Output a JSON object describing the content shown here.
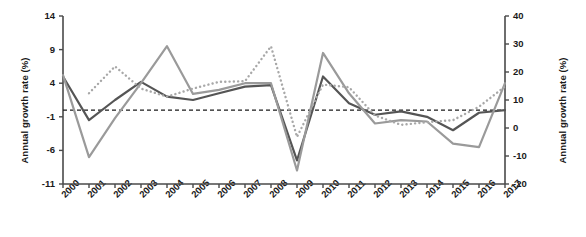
{
  "chart_data": {
    "type": "line",
    "title": "",
    "xlabel": "",
    "ylabel": "Annual growth rate (%)",
    "ylabel_right": "Annual growth rate (%)",
    "ylim": [
      -11,
      14
    ],
    "ylim_right": [
      -20,
      40
    ],
    "yticks": [
      14,
      9,
      4,
      -1,
      -6,
      -11
    ],
    "yticks_right": [
      40,
      30,
      20,
      10,
      0,
      -10,
      -20
    ],
    "grid": false,
    "legend": "none",
    "categories": [
      "2000",
      "2001",
      "2002",
      "2003",
      "2004",
      "2005",
      "2006",
      "2007",
      "2008",
      "2009",
      "2010",
      "2011",
      "2012",
      "2013",
      "2014",
      "2015",
      "2016",
      "2017"
    ],
    "reference_line": {
      "value": 0,
      "style": "dashed",
      "color": "#1a1a1a"
    },
    "series": [
      {
        "name": "series-dark-solid",
        "axis": "left",
        "style": "solid",
        "color": "#555555",
        "values": [
          5.0,
          -1.5,
          1.5,
          4.2,
          2.0,
          1.5,
          2.5,
          3.5,
          3.7,
          -7.5,
          5.0,
          1.0,
          -0.7,
          -0.2,
          -1.0,
          -3.0,
          -0.4,
          0.0
        ]
      },
      {
        "name": "series-gray-solid",
        "axis": "left",
        "style": "solid",
        "color": "#9a9a9a",
        "values": [
          5.2,
          -7.0,
          -1.2,
          4.0,
          9.5,
          2.4,
          3.0,
          4.0,
          4.0,
          -9.0,
          8.5,
          2.5,
          -2.0,
          -1.5,
          -1.7,
          -5.0,
          -5.5,
          4.0
        ]
      },
      {
        "name": "series-gray-dotted",
        "axis": "left",
        "style": "dotted",
        "color": "#a8a8a8",
        "values": [
          null,
          2.5,
          6.5,
          3.2,
          2.0,
          3.2,
          4.2,
          4.3,
          9.5,
          -4.0,
          3.8,
          3.4,
          -0.8,
          -2.2,
          -1.8,
          -1.5,
          0.5,
          3.5
        ]
      }
    ]
  },
  "axes": {
    "left_title": "Annual growth rate (%)",
    "right_title": "Annual growth rate (%)"
  }
}
